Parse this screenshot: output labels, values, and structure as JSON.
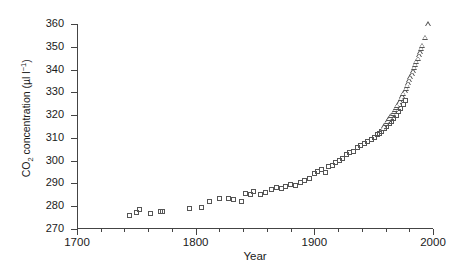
{
  "chart_data": {
    "type": "scatter",
    "title": "",
    "xlabel": "Year",
    "ylabel": "CO2 concentration (µl l⁻¹)",
    "ylabel_parts": {
      "prefix": "CO",
      "sub": "2",
      "mid": " concentration (µl l",
      "sup": "−1",
      "suffix": ")"
    },
    "xlim": [
      1700,
      2000
    ],
    "ylim": [
      270,
      360
    ],
    "grid": false,
    "legend": "none",
    "x_major_ticks": [
      1700,
      1800,
      1900,
      2000
    ],
    "x_major_tick_labels": [
      "1700",
      "1800",
      "1900",
      "2000"
    ],
    "x_minor_tick_interval": 20,
    "y_ticks": [
      270,
      280,
      290,
      300,
      310,
      320,
      330,
      340,
      350,
      360
    ],
    "y_tick_labels": [
      "270",
      "280",
      "290",
      "300",
      "310",
      "320",
      "330",
      "340",
      "350",
      "360"
    ],
    "marker_colors": {
      "ice_core": "#555555",
      "atmospheric": "#555555"
    },
    "series": [
      {
        "name": "ice core record",
        "marker": "square",
        "points": [
          [
            1744,
            276.1
          ],
          [
            1750,
            277.3
          ],
          [
            1753,
            278.4
          ],
          [
            1762,
            276.6
          ],
          [
            1770,
            277.5
          ],
          [
            1772,
            277.8
          ],
          [
            1795,
            279.1
          ],
          [
            1805,
            279.4
          ],
          [
            1812,
            281.9
          ],
          [
            1820,
            283.2
          ],
          [
            1828,
            283.6
          ],
          [
            1832,
            283.0
          ],
          [
            1839,
            282.2
          ],
          [
            1842,
            285.5
          ],
          [
            1846,
            285.0
          ],
          [
            1849,
            286.4
          ],
          [
            1855,
            285.1
          ],
          [
            1859,
            286.0
          ],
          [
            1864,
            287.5
          ],
          [
            1868,
            288.3
          ],
          [
            1872,
            288.0
          ],
          [
            1876,
            288.8
          ],
          [
            1880,
            289.6
          ],
          [
            1884,
            289.0
          ],
          [
            1888,
            290.4
          ],
          [
            1892,
            291.3
          ],
          [
            1896,
            292.0
          ],
          [
            1900,
            294.2
          ],
          [
            1903,
            295.4
          ],
          [
            1906,
            296.1
          ],
          [
            1909,
            295.0
          ],
          [
            1912,
            297.3
          ],
          [
            1915,
            298.0
          ],
          [
            1918,
            299.4
          ],
          [
            1921,
            300.2
          ],
          [
            1924,
            301.1
          ],
          [
            1927,
            302.5
          ],
          [
            1930,
            303.4
          ],
          [
            1933,
            304.2
          ],
          [
            1936,
            305.6
          ],
          [
            1939,
            306.5
          ],
          [
            1942,
            307.4
          ],
          [
            1945,
            308.2
          ],
          [
            1948,
            309.1
          ],
          [
            1951,
            310.0
          ],
          [
            1953,
            311.6
          ],
          [
            1955,
            312.0
          ],
          [
            1957,
            313.0
          ],
          [
            1959,
            314.2
          ],
          [
            1961,
            315.0
          ],
          [
            1963,
            316.2
          ],
          [
            1965,
            317.4
          ],
          [
            1967,
            318.6
          ],
          [
            1969,
            320.0
          ],
          [
            1971,
            321.4
          ],
          [
            1973,
            323.0
          ],
          [
            1975,
            324.8
          ],
          [
            1977,
            326.4
          ]
        ]
      },
      {
        "name": "direct atmospheric measurements",
        "marker": "triangle",
        "points": [
          [
            1958,
            314.0
          ],
          [
            1959,
            315.1
          ],
          [
            1960,
            316.3
          ],
          [
            1961,
            317.0
          ],
          [
            1962,
            317.8
          ],
          [
            1963,
            318.5
          ],
          [
            1964,
            319.0
          ],
          [
            1965,
            319.8
          ],
          [
            1966,
            320.6
          ],
          [
            1967,
            321.5
          ],
          [
            1968,
            322.4
          ],
          [
            1969,
            323.3
          ],
          [
            1970,
            324.2
          ],
          [
            1971,
            325.1
          ],
          [
            1972,
            326.0
          ],
          [
            1973,
            327.2
          ],
          [
            1974,
            328.3
          ],
          [
            1975,
            329.4
          ],
          [
            1976,
            330.5
          ],
          [
            1977,
            331.6
          ],
          [
            1978,
            332.8
          ],
          [
            1979,
            334.0
          ],
          [
            1980,
            335.3
          ],
          [
            1981,
            336.6
          ],
          [
            1982,
            337.9
          ],
          [
            1983,
            339.3
          ],
          [
            1984,
            340.7
          ],
          [
            1985,
            342.0
          ],
          [
            1986,
            343.4
          ],
          [
            1987,
            344.8
          ],
          [
            1988,
            346.3
          ],
          [
            1989,
            347.6
          ],
          [
            1990,
            349.0
          ],
          [
            1991,
            350.3
          ],
          [
            1993,
            354.0
          ],
          [
            1996,
            359.8
          ]
        ]
      }
    ]
  }
}
